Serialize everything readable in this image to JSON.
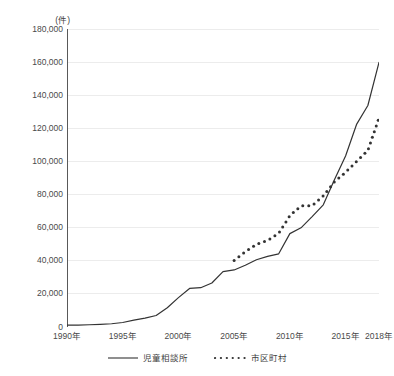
{
  "chart_data": {
    "type": "line",
    "title": "",
    "subtitle": "",
    "unit_label": "(件)",
    "xlabel": "",
    "ylabel": "",
    "xlim": [
      1990,
      2018
    ],
    "ylim": [
      0,
      180000
    ],
    "grid": true,
    "grid_axis": "y",
    "legend_position": "bottom-center",
    "y_ticks": [
      0,
      20000,
      40000,
      60000,
      80000,
      100000,
      120000,
      140000,
      160000,
      180000
    ],
    "y_tick_labels": [
      "0",
      "20,000",
      "40,000",
      "60,000",
      "80,000",
      "100,000",
      "120,000",
      "140,000",
      "160,000",
      "180,000"
    ],
    "x_ticks": [
      1990,
      1995,
      2000,
      2005,
      2010,
      2015,
      2018
    ],
    "x_tick_labels": [
      "1990年",
      "1995年",
      "2000年",
      "2005年",
      "2010年",
      "2015年",
      "2018年"
    ],
    "x": [
      1990,
      1991,
      1992,
      1993,
      1994,
      1995,
      1996,
      1997,
      1998,
      1999,
      2000,
      2001,
      2002,
      2003,
      2004,
      2005,
      2006,
      2007,
      2008,
      2009,
      2010,
      2011,
      2012,
      2013,
      2014,
      2015,
      2016,
      2017,
      2018
    ],
    "series": [
      {
        "name": "児童相談所",
        "style": "solid",
        "color": "#333333",
        "x": [
          1990,
          1991,
          1992,
          1993,
          1994,
          1995,
          1996,
          1997,
          1998,
          1999,
          2000,
          2001,
          2002,
          2003,
          2004,
          2005,
          2006,
          2007,
          2008,
          2009,
          2010,
          2011,
          2012,
          2013,
          2014,
          2015,
          2016,
          2017,
          2018
        ],
        "values": [
          1101,
          1171,
          1372,
          1611,
          1961,
          2722,
          4102,
          5352,
          6932,
          11631,
          17725,
          23274,
          23738,
          26569,
          33408,
          34472,
          37323,
          40639,
          42664,
          44211,
          56384,
          59919,
          66701,
          73802,
          88931,
          103286,
          122575,
          133778,
          159838
        ]
      },
      {
        "name": "市区町村",
        "style": "dotted",
        "color": "#333333",
        "x": [
          2005,
          2006,
          2007,
          2008,
          2009,
          2010,
          2011,
          2012,
          2013,
          2014,
          2015,
          2016,
          2017,
          2018
        ],
        "values": [
          40222,
          45441,
          49895,
          52282,
          56606,
          67232,
          73200,
          73200,
          79186,
          87694,
          93458,
          100147,
          106615,
          126246
        ]
      }
    ],
    "annotations": []
  },
  "legend": {
    "items": [
      {
        "label": "児童相談所",
        "style": "solid"
      },
      {
        "label": "市区町村",
        "style": "dotted"
      }
    ]
  }
}
